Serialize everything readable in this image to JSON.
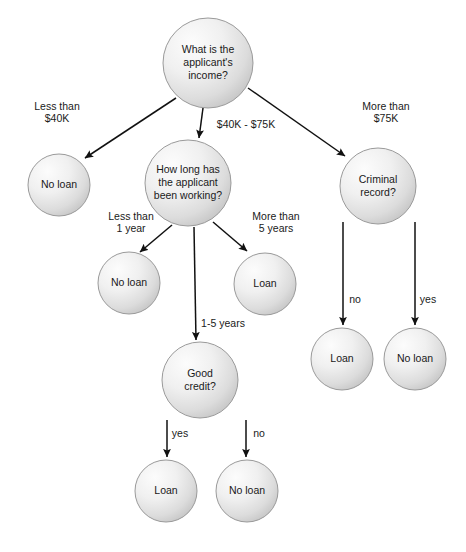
{
  "diagram": {
    "type": "decision-tree",
    "canvas": {
      "width": 466,
      "height": 552,
      "background": "#ffffff"
    },
    "style": {
      "node_fill_light": "#f4f4f4",
      "node_fill_dark": "#cfcfcf",
      "node_stroke": "#9a9a9a",
      "edge_color": "#111111",
      "text_color": "#1a1a1a"
    },
    "nodes": [
      {
        "id": "income",
        "kind": "decision",
        "label": "What is the applicant's income?",
        "lines": [
          "What is the",
          "applicant's",
          "income?"
        ],
        "cx": 208,
        "cy": 63,
        "r": 45
      },
      {
        "id": "noloan_lowincome",
        "kind": "leaf",
        "label": "No loan",
        "lines": [
          "No loan"
        ],
        "cx": 59,
        "cy": 185,
        "r": 31
      },
      {
        "id": "working",
        "kind": "decision",
        "label": "How long has the applicant been working?",
        "lines": [
          "How long has",
          "the applicant",
          "been working?"
        ],
        "cx": 188,
        "cy": 183,
        "r": 43
      },
      {
        "id": "criminal",
        "kind": "decision",
        "label": "Criminal record?",
        "lines": [
          "Criminal",
          "record?"
        ],
        "cx": 378,
        "cy": 186,
        "r": 38
      },
      {
        "id": "noloan_short",
        "kind": "leaf",
        "label": "No loan",
        "lines": [
          "No loan"
        ],
        "cx": 129,
        "cy": 283,
        "r": 31
      },
      {
        "id": "loan_long",
        "kind": "leaf",
        "label": "Loan",
        "lines": [
          "Loan"
        ],
        "cx": 265,
        "cy": 284,
        "r": 31
      },
      {
        "id": "credit",
        "kind": "decision",
        "label": "Good credit?",
        "lines": [
          "Good",
          "credit?"
        ],
        "cx": 200,
        "cy": 380,
        "r": 38
      },
      {
        "id": "loan_goodcredit",
        "kind": "leaf",
        "label": "Loan",
        "lines": [
          "Loan"
        ],
        "cx": 166,
        "cy": 491,
        "r": 31
      },
      {
        "id": "noloan_badcredit",
        "kind": "leaf",
        "label": "No loan",
        "lines": [
          "No loan"
        ],
        "cx": 247,
        "cy": 491,
        "r": 31
      },
      {
        "id": "loan_norecord",
        "kind": "leaf",
        "label": "Loan",
        "lines": [
          "Loan"
        ],
        "cx": 342,
        "cy": 359,
        "r": 31
      },
      {
        "id": "noloan_record",
        "kind": "leaf",
        "label": "No loan",
        "lines": [
          "No loan"
        ],
        "cx": 415,
        "cy": 359,
        "r": 31
      }
    ],
    "edges": [
      {
        "id": "e-income-lt40k",
        "from": "income",
        "to": "noloan_lowincome",
        "label": "Less than $40K",
        "label_lines": [
          "Less than",
          "$40K"
        ],
        "label_x": 57,
        "label_y": 110,
        "x1": 176,
        "y1": 98,
        "x2": 85,
        "y2": 158
      },
      {
        "id": "e-income-mid",
        "from": "income",
        "to": "working",
        "label": "$40K - $75K",
        "label_lines": [
          "$40K - $75K"
        ],
        "label_x": 246,
        "label_y": 128,
        "x1": 203,
        "y1": 108,
        "x2": 199,
        "y2": 138
      },
      {
        "id": "e-income-gt75k",
        "from": "income",
        "to": "criminal",
        "label": "More than $75K",
        "label_lines": [
          "More than",
          "$75K"
        ],
        "label_x": 386,
        "label_y": 110,
        "x1": 248,
        "y1": 88,
        "x2": 345,
        "y2": 156
      },
      {
        "id": "e-working-lt1y",
        "from": "working",
        "to": "noloan_short",
        "label": "Less than 1 year",
        "label_lines": [
          "Less than",
          "1 year"
        ],
        "label_x": 131,
        "label_y": 220,
        "x1": 172,
        "y1": 225,
        "x2": 140,
        "y2": 252
      },
      {
        "id": "e-working-1to5",
        "from": "working",
        "to": "credit",
        "label": "1-5 years",
        "label_lines": [
          "1-5 years"
        ],
        "label_x": 223,
        "label_y": 327,
        "x1": 194,
        "y1": 227,
        "x2": 196,
        "y2": 340
      },
      {
        "id": "e-working-gt5y",
        "from": "working",
        "to": "loan_long",
        "label": "More than 5 years",
        "label_lines": [
          "More than",
          "5 years"
        ],
        "label_x": 276,
        "label_y": 220,
        "x1": 213,
        "y1": 222,
        "x2": 247,
        "y2": 251
      },
      {
        "id": "e-credit-yes",
        "from": "credit",
        "to": "loan_goodcredit",
        "label": "yes",
        "label_lines": [
          "yes"
        ],
        "label_x": 180,
        "label_y": 437,
        "x1": 167,
        "y1": 420,
        "x2": 167,
        "y2": 457
      },
      {
        "id": "e-credit-no",
        "from": "credit",
        "to": "noloan_badcredit",
        "label": "no",
        "label_lines": [
          "no"
        ],
        "label_x": 259,
        "label_y": 437,
        "x1": 246,
        "y1": 420,
        "x2": 246,
        "y2": 457
      },
      {
        "id": "e-criminal-no",
        "from": "criminal",
        "to": "loan_norecord",
        "label": "no",
        "label_lines": [
          "no"
        ],
        "label_x": 355,
        "label_y": 303,
        "x1": 343,
        "y1": 222,
        "x2": 343,
        "y2": 325
      },
      {
        "id": "e-criminal-yes",
        "from": "criminal",
        "to": "noloan_record",
        "label": "yes",
        "label_lines": [
          "yes"
        ],
        "label_x": 428,
        "label_y": 303,
        "x1": 415,
        "y1": 222,
        "x2": 415,
        "y2": 325
      }
    ]
  }
}
